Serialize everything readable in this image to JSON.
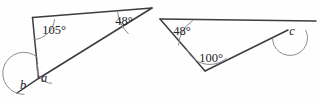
{
  "figure": {
    "background_color": "#fefefe",
    "line_color": "#3c3c42",
    "arc_color": "#8b8b92",
    "text_color": "#25252a"
  },
  "left_triangle": {
    "name": "left-triangle",
    "angles": [
      {
        "id": "top-left",
        "label": "105°",
        "x": 54,
        "y": 31
      },
      {
        "id": "apex-right",
        "label": "48°",
        "x": 124,
        "y": 22
      },
      {
        "id": "interior-bottom",
        "label": "a",
        "x": 44,
        "y": 79
      },
      {
        "id": "exterior-bottom",
        "label": "b",
        "x": 23,
        "y": 86
      }
    ]
  },
  "right_triangle": {
    "name": "right-triangle",
    "angles": [
      {
        "id": "left",
        "label": "48°",
        "x": 182,
        "y": 32
      },
      {
        "id": "bottom",
        "label": "100°",
        "x": 211,
        "y": 59
      },
      {
        "id": "exterior-right",
        "label": "c",
        "x": 292,
        "y": 32
      }
    ]
  }
}
